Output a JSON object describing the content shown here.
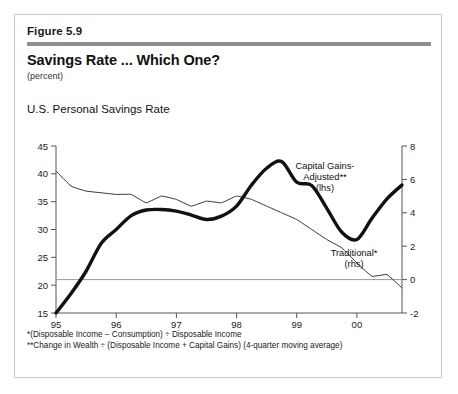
{
  "figure": {
    "number": "Figure 5.9",
    "title": "Savings Rate ... Which One?",
    "units": "(percent)",
    "chart_heading": "U.S. Personal Savings Rate",
    "footnote_1": "*(Disposable Income − Consumption) ÷ Disposable Income",
    "footnote_2": "**Change in Wealth ÷ (Disposable Income + Capital Gains)   (4-quarter moving average)"
  },
  "annotations": {
    "series_a_line1": "Capital Gains-",
    "series_a_line2": "Adjusted**",
    "series_a_line3": "(lhs)",
    "series_b_line1": "Traditional*",
    "series_b_line2": "(rhs)"
  },
  "axes": {
    "left_ticks": [
      "45",
      "40",
      "35",
      "30",
      "25",
      "20",
      "15"
    ],
    "right_ticks": [
      "8",
      "6",
      "4",
      "2",
      "0",
      "-2"
    ],
    "x_ticks": [
      "95",
      "96",
      "97",
      "98",
      "99",
      "00"
    ]
  },
  "colors": {
    "rule": "#8f8f8f",
    "frame": "#c9c9c9",
    "axis": "#555555",
    "zero_line": "#999999",
    "series_a": "#111111",
    "series_b": "#333333"
  },
  "chart_data": {
    "type": "line",
    "title": "U.S. Personal Savings Rate",
    "subtitle": "Savings Rate ... Which One?",
    "xlabel": "",
    "ylabel": "percent",
    "grid": false,
    "legend": "annotations-inline",
    "xlim": [
      1995.0,
      2000.75
    ],
    "x_tick_values": [
      1995,
      1996,
      1997,
      1998,
      1999,
      2000
    ],
    "x_tick_labels": [
      "95",
      "96",
      "97",
      "98",
      "99",
      "00"
    ],
    "y_left": {
      "label": "Capital Gains-Adjusted** (lhs)",
      "lim": [
        15,
        45
      ],
      "ticks": [
        15,
        20,
        25,
        30,
        35,
        40,
        45
      ]
    },
    "y_right": {
      "label": "Traditional* (rhs)",
      "lim": [
        -2,
        8
      ],
      "ticks": [
        -2,
        0,
        2,
        4,
        6,
        8
      ],
      "zero_reference_line": 0
    },
    "series": [
      {
        "name": "Capital Gains-Adjusted**",
        "axis": "left",
        "style": "thick",
        "x": [
          1995.0,
          1995.25,
          1995.5,
          1995.75,
          1996.0,
          1996.25,
          1996.5,
          1996.75,
          1997.0,
          1997.25,
          1997.5,
          1997.75,
          1998.0,
          1998.25,
          1998.5,
          1998.75,
          1999.0,
          1999.25,
          1999.5,
          1999.75,
          2000.0,
          2000.25,
          2000.5,
          2000.75
        ],
        "values": [
          15.0,
          18.5,
          22.5,
          27.5,
          30.0,
          32.5,
          33.5,
          33.6,
          33.3,
          32.6,
          31.8,
          32.4,
          34.2,
          38.0,
          41.0,
          42.2,
          38.5,
          37.9,
          33.8,
          29.5,
          28.2,
          32.0,
          35.5,
          38.0
        ]
      },
      {
        "name": "Traditional*",
        "axis": "right",
        "style": "thin",
        "x": [
          1995.0,
          1995.25,
          1995.5,
          1995.75,
          1996.0,
          1996.25,
          1996.5,
          1996.75,
          1997.0,
          1997.25,
          1997.5,
          1997.75,
          1998.0,
          1998.25,
          1998.5,
          1998.75,
          1999.0,
          1999.25,
          1999.5,
          1999.75,
          2000.0,
          2000.25,
          2000.5,
          2000.75
        ],
        "values": [
          6.5,
          5.6,
          5.3,
          5.2,
          5.1,
          5.1,
          4.6,
          5.0,
          4.8,
          4.4,
          4.7,
          4.6,
          5.0,
          4.8,
          4.4,
          4.0,
          3.6,
          3.0,
          2.4,
          1.9,
          1.0,
          0.2,
          0.3,
          -0.5
        ]
      }
    ],
    "series_right_extra": {
      "name": "Capital Gains-Adjusted** (converted onto right axis for plotting reference)",
      "note": "left-axis values used; right axis shown for Traditional* only"
    }
  }
}
